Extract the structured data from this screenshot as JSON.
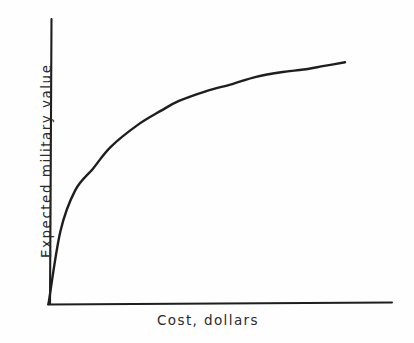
{
  "figure": {
    "background_color": "#fefefe",
    "ink_color": "#1e1e1e",
    "style": "hand-drawn line drawing"
  },
  "chart_data": {
    "type": "line",
    "title": "",
    "subtitle": "",
    "xlabel": "Cost, dollars",
    "ylabel": "Expected military value",
    "grid": false,
    "legend": null,
    "tick_labels": {
      "x": [],
      "y": []
    },
    "xlim": [
      0,
      1
    ],
    "ylim": [
      0,
      1
    ],
    "annotations": [],
    "series": [
      {
        "name": "Expected military value vs cost",
        "description": "Concave-down curve of diminishing returns rising steeply from the origin and flattening toward an asymptote",
        "x": [
          0.0,
          0.04,
          0.09,
          0.15,
          0.21,
          0.3,
          0.38,
          0.44,
          0.53,
          0.62,
          0.7,
          0.79,
          0.86,
          0.93,
          1.0
        ],
        "y": [
          0.0,
          0.3,
          0.47,
          0.56,
          0.65,
          0.74,
          0.8,
          0.84,
          0.88,
          0.91,
          0.94,
          0.96,
          0.97,
          0.985,
          1.0
        ]
      }
    ]
  },
  "axes": {
    "x_axis_name": "cost-axis",
    "y_axis_name": "value-axis"
  },
  "labels": {
    "x_axis_text": "Cost, dollars",
    "y_axis_text": "Expected military value"
  }
}
